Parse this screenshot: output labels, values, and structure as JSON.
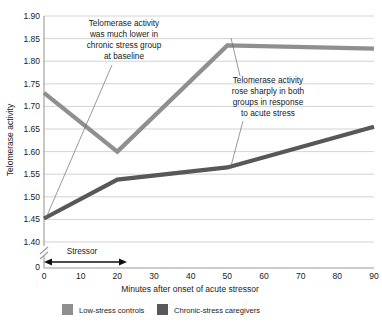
{
  "chart_data": {
    "type": "line",
    "title": "",
    "xlabel": "Minutes after onset of acute stressor",
    "ylabel": "Telomerase activity",
    "x": [
      0,
      10,
      20,
      30,
      40,
      50,
      60,
      70,
      80,
      90
    ],
    "xlim": [
      0,
      90
    ],
    "ylim": [
      1.4,
      1.9
    ],
    "y_axis_break": true,
    "y_axis_zero_label": "0",
    "grid": true,
    "legend_position": "bottom",
    "xticklabels": [
      "0",
      "10",
      "20",
      "30",
      "40",
      "50",
      "60",
      "70",
      "80",
      "90"
    ],
    "yticklabels": [
      "1.40",
      "1.45",
      "1.50",
      "1.55",
      "1.60",
      "1.65",
      "1.70",
      "1.75",
      "1.80",
      "1.85",
      "1.90"
    ],
    "series": [
      {
        "name": "Low-stress controls",
        "color": "#8f8f8f",
        "x": [
          0,
          20,
          50,
          90
        ],
        "values": [
          1.73,
          1.6,
          1.835,
          1.828
        ]
      },
      {
        "name": "Chronic-stress caregivers",
        "color": "#585858",
        "x": [
          0,
          20,
          50,
          90
        ],
        "values": [
          1.452,
          1.538,
          1.565,
          1.655
        ]
      }
    ],
    "annotations": [
      {
        "id": "baseline-note",
        "lines": [
          "Telomerase activity",
          "was much lower in",
          "chronic stress group",
          "at baseline"
        ],
        "points_to": {
          "x": 0,
          "y": 1.452
        }
      },
      {
        "id": "acute-stress-note",
        "lines": [
          "Telomerase activity",
          "rose sharply in both",
          "groups in response",
          "to acute stress"
        ],
        "points_to": {
          "x": 50,
          "y": 1.835
        }
      }
    ],
    "span_marker": {
      "label": "Stressor",
      "from": 0,
      "to": 22
    }
  },
  "legend": {
    "items": [
      {
        "label": "Low-stress controls",
        "color": "#8f8f8f"
      },
      {
        "label": "Chronic-stress caregivers",
        "color": "#585858"
      }
    ]
  }
}
